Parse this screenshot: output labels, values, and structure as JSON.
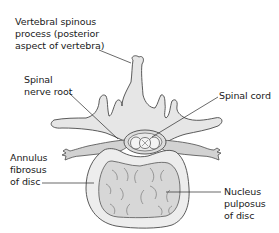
{
  "diagram": {
    "colors": {
      "bone_fill": "#e6e6e6",
      "disc_outer_fill": "#ececec",
      "disc_nucleus_fill": "#d6d6d6",
      "nerve_fill": "#cfcfcf",
      "outline": "#4a4a4a",
      "text": "#1a1a1a"
    },
    "labels": {
      "spinous_process": {
        "lines": [
          "Vertebral spinous",
          "process (posterior",
          "aspect of vertebra)"
        ]
      },
      "nerve_root": {
        "lines": [
          "Spinal",
          "nerve root"
        ]
      },
      "spinal_cord": {
        "lines": [
          "Spinal cord"
        ]
      },
      "annulus": {
        "lines": [
          "Annulus",
          "fibrosus",
          "of disc"
        ]
      },
      "nucleus": {
        "lines": [
          "Nucleus",
          "pulposus",
          "of disc"
        ]
      }
    }
  }
}
